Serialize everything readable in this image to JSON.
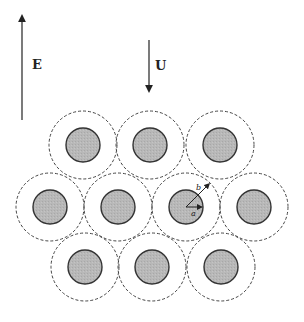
{
  "field_vector": {
    "label": "E",
    "x": 22,
    "y_start": 120,
    "y_end": 14,
    "direction": "up"
  },
  "velocity_vector": {
    "label": "U",
    "x": 149,
    "y_start": 40,
    "y_end": 93,
    "direction": "down"
  },
  "colors": {
    "stroke": "#333333",
    "particle_fill": "#b5b5b5",
    "background": "#ffffff"
  },
  "cell": {
    "inner_radius": 17,
    "outer_radius": 34,
    "inner_label": "a",
    "outer_label": "b"
  },
  "cells": [
    {
      "cx": 83,
      "cy": 145
    },
    {
      "cx": 150,
      "cy": 145
    },
    {
      "cx": 220,
      "cy": 145
    },
    {
      "cx": 50,
      "cy": 207
    },
    {
      "cx": 118,
      "cy": 207
    },
    {
      "cx": 186,
      "cy": 207,
      "annotated": true
    },
    {
      "cx": 254,
      "cy": 207
    },
    {
      "cx": 85,
      "cy": 267
    },
    {
      "cx": 152,
      "cy": 267
    },
    {
      "cx": 221,
      "cy": 267
    }
  ]
}
